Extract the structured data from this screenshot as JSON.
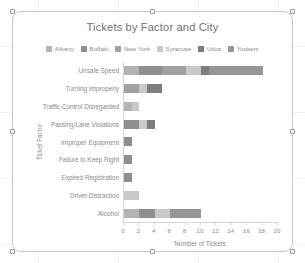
{
  "window": {
    "app": "spreadsheet-chart-object",
    "selected": true,
    "handles": [
      "top-left",
      "top-center",
      "top-right",
      "middle-left",
      "middle-right",
      "bottom-left",
      "bottom-center",
      "bottom-right"
    ]
  },
  "chart_data": {
    "type": "bar",
    "orientation": "horizontal",
    "stacked": true,
    "title": "Tickets by Factor and City",
    "xlabel": "Number of Tickets",
    "ylabel": "Ticket Factor",
    "xlim": [
      0,
      20
    ],
    "xticks": [
      0,
      2,
      4,
      6,
      8,
      10,
      12,
      14,
      16,
      18,
      20
    ],
    "grid": false,
    "legend_position": "top",
    "categories": [
      "Unsafe Speed",
      "Turning Improperly",
      "Traffic Control Disregarded",
      "Passing/Lane Violations",
      "Improper Equipment",
      "Failure to Keep Right",
      "Expired Registration",
      "Driver Distraction",
      "Alcohol"
    ],
    "series": [
      {
        "name": "Albany",
        "color": "#b4b4b4",
        "values": [
          2,
          0,
          1,
          0,
          0,
          0,
          0,
          0,
          2
        ]
      },
      {
        "name": "Buffalo",
        "color": "#8f8f8f",
        "values": [
          3,
          0,
          0,
          2,
          1,
          1,
          1,
          0,
          2
        ]
      },
      {
        "name": "New York",
        "color": "#a0a0a0",
        "values": [
          3,
          2,
          0,
          0,
          0,
          0,
          0,
          0,
          0
        ]
      },
      {
        "name": "Syracuse",
        "color": "#c9c9c9",
        "values": [
          2,
          1,
          1,
          1,
          0,
          0,
          0,
          2,
          2
        ]
      },
      {
        "name": "Utica",
        "color": "#7d7d7d",
        "values": [
          1,
          2,
          0,
          1,
          0,
          0,
          0,
          0,
          0
        ]
      },
      {
        "name": "Yonkers",
        "color": "#969696",
        "values": [
          7,
          0,
          0,
          0,
          0,
          0,
          0,
          0,
          4
        ]
      }
    ],
    "totals": [
      18,
      5,
      2,
      4,
      1,
      1,
      1,
      2,
      10
    ]
  }
}
